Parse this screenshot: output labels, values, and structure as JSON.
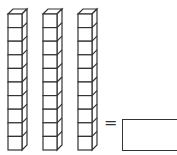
{
  "problem": {
    "label_fragment": ")",
    "rods": [
      {
        "name": "ten-rod-1",
        "cubes": 10
      },
      {
        "name": "ten-rod-2",
        "cubes": 10
      },
      {
        "name": "ten-rod-3",
        "cubes": 10
      }
    ],
    "equals_sign": "=",
    "answer_value": ""
  },
  "colors": {
    "stroke": "#333333",
    "fill": "#ffffff"
  }
}
